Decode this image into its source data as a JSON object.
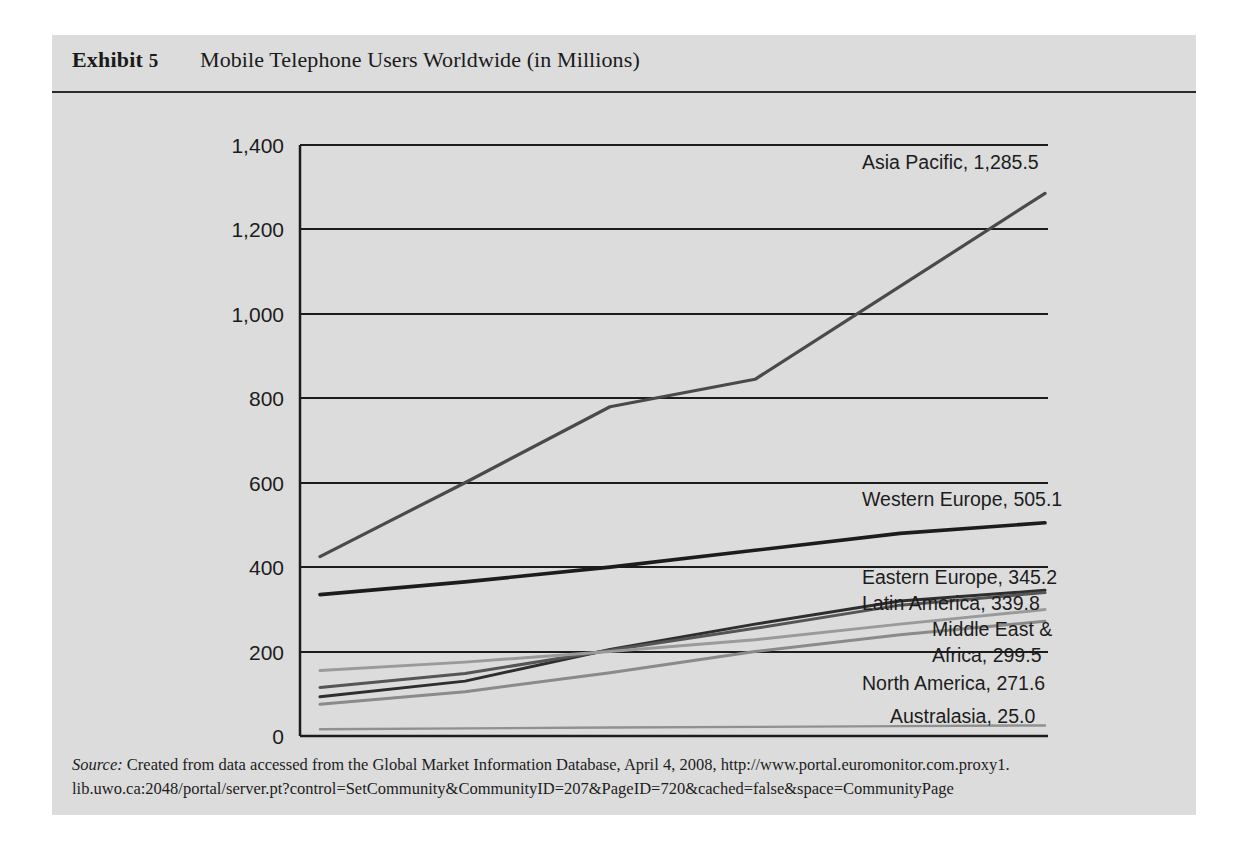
{
  "exhibit": {
    "label": "Exhibit",
    "number": "5",
    "title": "Mobile Telephone Users Worldwide (in Millions)"
  },
  "source": {
    "prefix": "Source:",
    "line1": " Created from data accessed from the Global Market Information Database, April 4, 2008, http://www.portal.euromonitor.com.proxy1.",
    "line2": "lib.uwo.ca:2048/portal/server.pt?control=SetCommunity&CommunityID=207&PageID=720&cached=false&space=CommunityPage"
  },
  "chart_data": {
    "type": "line",
    "title": "Mobile Telephone Users Worldwide (in Millions)",
    "xlabel": "",
    "ylabel": "",
    "x": [
      "2002",
      "2003",
      "2004",
      "2005",
      "2006",
      "2007"
    ],
    "ylim": [
      0,
      1400
    ],
    "yticks": [
      "0",
      "200",
      "400",
      "600",
      "800",
      "1,000",
      "1,200",
      "1,400"
    ],
    "ytick_values": [
      0,
      200,
      400,
      600,
      800,
      1000,
      1200,
      1400
    ],
    "grid": true,
    "legend": "end-of-line labels",
    "series": [
      {
        "name": "Asia Pacific",
        "end_value": "1,285.5",
        "label": "Asia Pacific, 1,285.5",
        "color": "#4a4a4a",
        "width": 3.2,
        "values": [
          425,
          600,
          780,
          845,
          1065,
          1285.5
        ]
      },
      {
        "name": "Western Europe",
        "end_value": "505.1",
        "label": "Western Europe, 505.1",
        "color": "#1c1c1c",
        "width": 3.6,
        "values": [
          335,
          365,
          400,
          440,
          480,
          505.1
        ]
      },
      {
        "name": "Eastern Europe",
        "end_value": "345.2",
        "label": "Eastern Europe, 345.2",
        "color": "#2e2e2e",
        "width": 3.0,
        "values": [
          93,
          130,
          205,
          265,
          320,
          345.2
        ]
      },
      {
        "name": "Latin America",
        "end_value": "339.8",
        "label": "Latin America, 339.8",
        "color": "#555555",
        "width": 3.0,
        "values": [
          115,
          148,
          203,
          255,
          310,
          339.8
        ]
      },
      {
        "name": "Middle East & Africa",
        "end_value": "299.5",
        "label_line1": "Middle East &",
        "label_line2": "Africa, 299.5",
        "color": "#9a9a9a",
        "width": 3.0,
        "values": [
          155,
          175,
          200,
          228,
          265,
          299.5
        ]
      },
      {
        "name": "North America",
        "end_value": "271.6",
        "label": "North America, 271.6",
        "color": "#8a8a8a",
        "width": 3.0,
        "values": [
          75,
          105,
          150,
          200,
          240,
          271.6
        ]
      },
      {
        "name": "Australasia",
        "end_value": "25.0",
        "label": "Australasia, 25.0",
        "color": "#909090",
        "width": 2.4,
        "values": [
          16,
          18,
          20,
          21.5,
          23.5,
          25.0
        ]
      }
    ]
  },
  "colors": {
    "panel": "#dcdcdc",
    "axis": "#1c1c1c",
    "grid": "#1c1c1c",
    "text": "#1c1c1c"
  }
}
